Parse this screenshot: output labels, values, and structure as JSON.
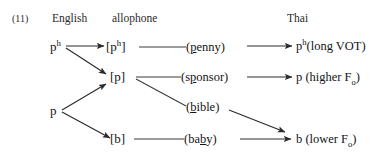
{
  "figure": {
    "number": "(11)",
    "headers": {
      "english": "English",
      "allophone": "allophone",
      "thai": "Thai"
    },
    "english_inputs": [
      {
        "id": "ph",
        "base": "p",
        "superscript": "h"
      },
      {
        "id": "p",
        "base": "p",
        "superscript": ""
      }
    ],
    "allophones": [
      {
        "id": "ph-allo",
        "text": "[p",
        "superscript": "h",
        "close": "]"
      },
      {
        "id": "p-allo",
        "text": "[p]",
        "superscript": "",
        "close": ""
      },
      {
        "id": "b-allo",
        "text": "[b]",
        "superscript": "",
        "close": ""
      }
    ],
    "examples": [
      {
        "id": "penny",
        "open": "(",
        "pre": "",
        "underlined": "p",
        "post": "enny",
        "close": ")"
      },
      {
        "id": "sponsor",
        "open": "(",
        "pre": "s",
        "underlined": "p",
        "post": "onsor",
        "close": ")"
      },
      {
        "id": "bible",
        "open": "(",
        "pre": "",
        "underlined": "b",
        "post": "ible",
        "close": ")"
      },
      {
        "id": "baby",
        "open": "(",
        "pre": "ba",
        "underlined": "b",
        "post": "y",
        "close": ")"
      }
    ],
    "thai_outcomes": [
      {
        "id": "long-vot",
        "base": "p",
        "superscript": "h",
        "text": "(long VOT)",
        "subscript": ""
      },
      {
        "id": "higher-f0",
        "base": "p",
        "superscript": "",
        "text": " (higher F",
        "subscript": "o",
        "tail": ")"
      },
      {
        "id": "lower-f0",
        "base": "b",
        "superscript": "",
        "text": " (lower F",
        "subscript": "o",
        "tail": ")"
      }
    ],
    "colors": {
      "ink": "#141414",
      "line": "#333333",
      "background": "#ffffff"
    }
  }
}
